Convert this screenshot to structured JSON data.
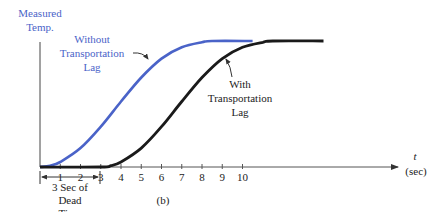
{
  "chart_data": {
    "type": "line",
    "title": "",
    "panel_label": "(b)",
    "ylabel": [
      "Measured",
      "Temp."
    ],
    "xlabel": [
      "t",
      "(sec)"
    ],
    "x_ticks": [
      "1",
      "2",
      "3",
      "4",
      "5",
      "6",
      "7",
      "8",
      "9",
      "10"
    ],
    "xlim": [
      0,
      14.5
    ],
    "ylim": [
      0,
      1
    ],
    "grid": false,
    "series": [
      {
        "name": "Without Transportation Lag",
        "label_lines": [
          "Without",
          "Transportation",
          "Lag"
        ],
        "color": "#4a63c8",
        "x": [
          0,
          0.5,
          1,
          2,
          3,
          4,
          5,
          6,
          7,
          8,
          8.5,
          10.5
        ],
        "y": [
          0,
          0.01,
          0.04,
          0.15,
          0.32,
          0.52,
          0.71,
          0.86,
          0.95,
          0.99,
          1.0,
          1.0
        ]
      },
      {
        "name": "With Transportation Lag",
        "label_lines": [
          "With",
          "Transportation",
          "Lag"
        ],
        "color": "#1a1a1a",
        "x": [
          0,
          3,
          3.5,
          4,
          5,
          6,
          7,
          8,
          9,
          10,
          11,
          11.5,
          14
        ],
        "y": [
          0,
          0,
          0.01,
          0.04,
          0.15,
          0.32,
          0.52,
          0.71,
          0.86,
          0.95,
          0.99,
          1.0,
          1.0
        ]
      }
    ],
    "annotations": {
      "dead_time": [
        "3 Sec of",
        "Dead",
        "Time"
      ],
      "dead_time_span": [
        0,
        3
      ]
    }
  }
}
